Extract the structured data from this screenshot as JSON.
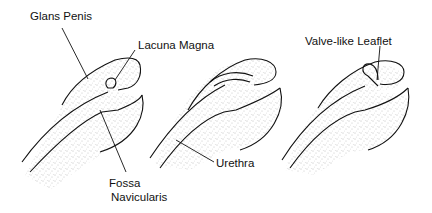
{
  "diagram": {
    "panels": [
      {
        "id": "panel-1",
        "description": "normal glans with lacuna magna and fossa navicularis"
      },
      {
        "id": "panel-2",
        "description": "urethra with lacuna magna forming recess"
      },
      {
        "id": "panel-3",
        "description": "lacuna magna with valve-like leaflet"
      }
    ],
    "labels": {
      "glans_penis": "Glans Penis",
      "lacuna_magna": "Lacuna Magna",
      "fossa_line1": "Fossa",
      "fossa_line2": "Navicularis",
      "urethra": "Urethra",
      "valve_leaflet": "Valve-like Leaflet"
    },
    "colors": {
      "ink": "#111111",
      "stipple": "#8a8a8a",
      "background": "#ffffff"
    }
  }
}
